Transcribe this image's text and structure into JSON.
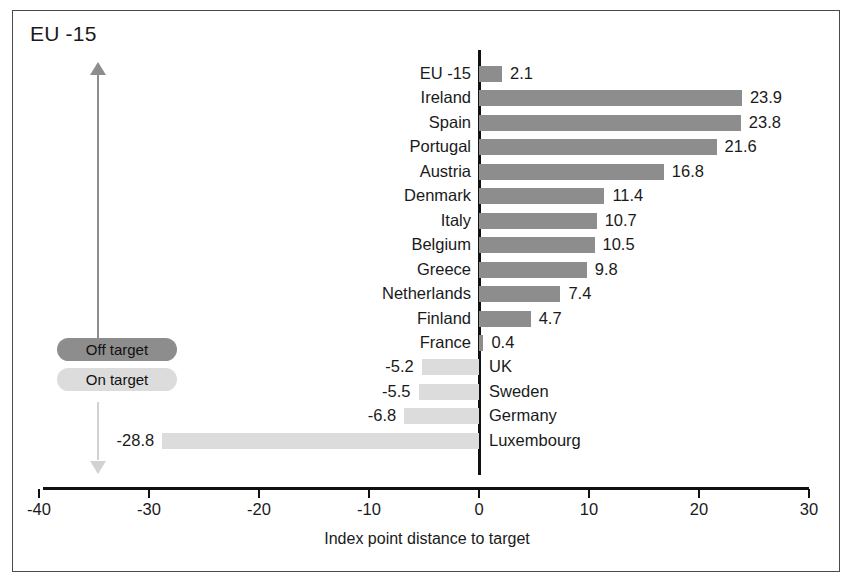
{
  "frame": {
    "title": "EU -15"
  },
  "legend": {
    "position": "left-middle",
    "items": [
      {
        "label": "Off target",
        "color": "#8d8d8d",
        "key": "off"
      },
      {
        "label": "On target",
        "color": "#dcdcdc",
        "key": "on"
      }
    ]
  },
  "arrow": {
    "name": "vertical-direction-arrow",
    "up_color": "#8d8d8d",
    "down_color": "#d2d2d2"
  },
  "chart_data": {
    "type": "bar",
    "orientation": "horizontal",
    "title": "EU -15",
    "xlabel": "Index point distance to target",
    "ylabel": "",
    "xlim": [
      -40,
      30
    ],
    "xticks": [
      -40,
      -30,
      -20,
      -10,
      0,
      10,
      20,
      30
    ],
    "xticklabels": [
      "-40",
      "-30",
      "-20",
      "-10",
      "0",
      "10",
      "20",
      "30"
    ],
    "grid": false,
    "legend_entries": [
      "Off target",
      "On target"
    ],
    "colors": {
      "off_target": "#8d8d8d",
      "on_target": "#dcdcdc"
    },
    "categories": [
      "EU -15",
      "Ireland",
      "Spain",
      "Portugal",
      "Austria",
      "Denmark",
      "Italy",
      "Belgium",
      "Greece",
      "Netherlands",
      "Finland",
      "France",
      "UK",
      "Sweden",
      "Germany",
      "Luxembourg"
    ],
    "values": [
      2.1,
      23.9,
      23.8,
      21.6,
      16.8,
      11.4,
      10.7,
      10.5,
      9.8,
      7.4,
      4.7,
      0.4,
      -5.2,
      -5.5,
      -6.8,
      -28.8
    ],
    "value_labels": [
      "2.1",
      "23.9",
      "23.8",
      "21.6",
      "16.8",
      "11.4",
      "10.7",
      "10.5",
      "9.8",
      "7.4",
      "4.7",
      "0.4",
      "-5.2",
      "-5.5",
      "-6.8",
      "-28.8"
    ],
    "series": [
      {
        "name": "Index point distance to target",
        "values": [
          2.1,
          23.9,
          23.8,
          21.6,
          16.8,
          11.4,
          10.7,
          10.5,
          9.8,
          7.4,
          4.7,
          0.4,
          -5.2,
          -5.5,
          -6.8,
          -28.8
        ]
      }
    ],
    "rows": [
      {
        "category": "EU -15",
        "value": 2.1,
        "value_label": "2.1",
        "group": "off"
      },
      {
        "category": "Ireland",
        "value": 23.9,
        "value_label": "23.9",
        "group": "off"
      },
      {
        "category": "Spain",
        "value": 23.8,
        "value_label": "23.8",
        "group": "off"
      },
      {
        "category": "Portugal",
        "value": 21.6,
        "value_label": "21.6",
        "group": "off"
      },
      {
        "category": "Austria",
        "value": 16.8,
        "value_label": "16.8",
        "group": "off"
      },
      {
        "category": "Denmark",
        "value": 11.4,
        "value_label": "11.4",
        "group": "off"
      },
      {
        "category": "Italy",
        "value": 10.7,
        "value_label": "10.7",
        "group": "off"
      },
      {
        "category": "Belgium",
        "value": 10.5,
        "value_label": "10.5",
        "group": "off"
      },
      {
        "category": "Greece",
        "value": 9.8,
        "value_label": "9.8",
        "group": "off"
      },
      {
        "category": "Netherlands",
        "value": 7.4,
        "value_label": "7.4",
        "group": "off"
      },
      {
        "category": "Finland",
        "value": 4.7,
        "value_label": "4.7",
        "group": "off"
      },
      {
        "category": "France",
        "value": 0.4,
        "value_label": "0.4",
        "group": "off"
      },
      {
        "category": "UK",
        "value": -5.2,
        "value_label": "-5.2",
        "group": "on"
      },
      {
        "category": "Sweden",
        "value": -5.5,
        "value_label": "-5.5",
        "group": "on"
      },
      {
        "category": "Germany",
        "value": -6.8,
        "value_label": "-6.8",
        "group": "on"
      },
      {
        "category": "Luxembourg",
        "value": -28.8,
        "value_label": "-28.8",
        "group": "on"
      }
    ]
  }
}
